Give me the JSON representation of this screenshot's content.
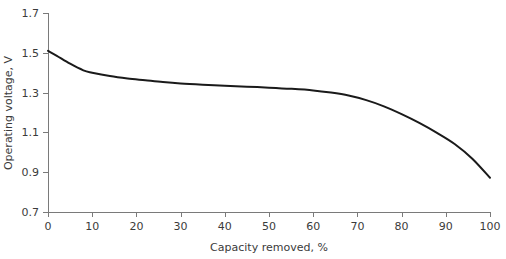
{
  "chart_data": {
    "type": "line",
    "title": "",
    "subtitle": "",
    "xlabel": "Capacity removed, %",
    "ylabel": "Operating voltage, V",
    "xlim": [
      0,
      100
    ],
    "ylim": [
      0.7,
      1.7
    ],
    "xticks": [
      "0",
      "10",
      "20",
      "30",
      "40",
      "50",
      "60",
      "70",
      "80",
      "90",
      "100"
    ],
    "xtick_values": [
      0,
      10,
      20,
      30,
      40,
      50,
      60,
      70,
      80,
      90,
      100
    ],
    "yticks": [
      "0.7",
      "0.9",
      "1.1",
      "1.3",
      "1.5",
      "1.7"
    ],
    "ytick_values": [
      0.7,
      0.9,
      1.1,
      1.3,
      1.5,
      1.7
    ],
    "grid": false,
    "legend": "none",
    "series": [
      {
        "name": "discharge-curve",
        "color": "#1a1a1a",
        "x": [
          0,
          2,
          5,
          8,
          10,
          14,
          18,
          22,
          26,
          30,
          35,
          40,
          45,
          50,
          55,
          60,
          64,
          68,
          72,
          76,
          80,
          84,
          88,
          92,
          96,
          100
        ],
        "y": [
          1.51,
          1.485,
          1.445,
          1.412,
          1.4,
          1.383,
          1.371,
          1.362,
          1.353,
          1.346,
          1.34,
          1.335,
          1.33,
          1.325,
          1.319,
          1.311,
          1.3,
          1.285,
          1.262,
          1.231,
          1.192,
          1.148,
          1.098,
          1.042,
          0.968,
          0.872
        ]
      }
    ]
  },
  "axes": {
    "x_tick_label_color": "#3b3b3b",
    "y_tick_label_color": "#3b3b3b",
    "axis_color": "#7a7a7a",
    "curve_color": "#1a1a1a"
  }
}
